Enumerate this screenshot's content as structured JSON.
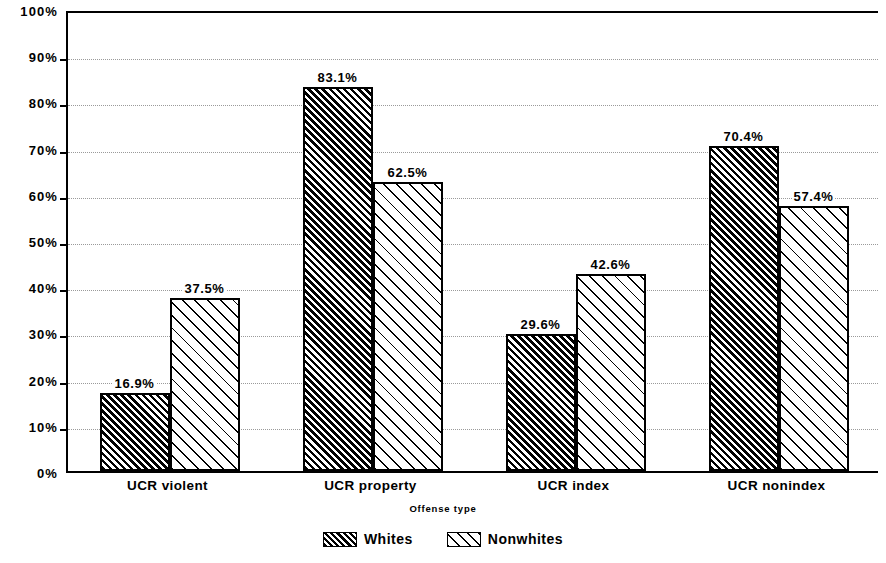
{
  "chart_data": {
    "type": "bar",
    "title": "",
    "subtitle": "",
    "xlabel": "Offense type",
    "ylabel": "",
    "categories": [
      "UCR violent",
      "UCR property",
      "UCR index",
      "UCR nonindex"
    ],
    "series": [
      {
        "name": "Whites",
        "values": [
          16.9,
          83.1,
          29.6,
          70.4
        ],
        "labels": [
          "16.9%",
          "83.1%",
          "29.6%",
          "70.4%"
        ],
        "pattern": "dense-diagonal-hatch"
      },
      {
        "name": "Nonwhites",
        "values": [
          37.5,
          62.5,
          42.6,
          57.4
        ],
        "labels": [
          "37.5%",
          "62.5%",
          "42.6%",
          "57.4%"
        ],
        "pattern": "sparse-diagonal-hatch"
      }
    ],
    "ylim": [
      0,
      100
    ],
    "ytick_values": [
      0,
      10,
      20,
      30,
      40,
      50,
      60,
      70,
      80,
      90,
      100
    ],
    "ytick_labels": [
      "0%",
      "10%",
      "20%",
      "30%",
      "40%",
      "50%",
      "60%",
      "70%",
      "80%",
      "90%",
      "100%"
    ],
    "grid": true,
    "grid_style": "dotted-horizontal",
    "legend_position": "bottom-center",
    "colors": {
      "foreground": "#000000",
      "background": "#ffffff",
      "gridline": "#9a9a9a"
    }
  },
  "axis": {
    "x_title": "Offense type"
  },
  "legend": {
    "items": [
      {
        "label": "Whites"
      },
      {
        "label": "Nonwhites"
      }
    ]
  }
}
